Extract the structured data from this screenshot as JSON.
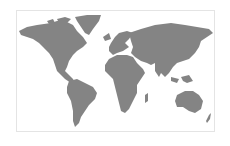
{
  "map": {
    "type": "world-map",
    "projection": "equirectangular",
    "land_color": "#848484",
    "water_color": "#ffffff",
    "border_color": "#e4e4e4",
    "regions": [
      "North America",
      "Greenland",
      "South America",
      "Europe",
      "Africa",
      "Asia",
      "Australia",
      "New Zealand",
      "Antarctica excluded"
    ]
  }
}
